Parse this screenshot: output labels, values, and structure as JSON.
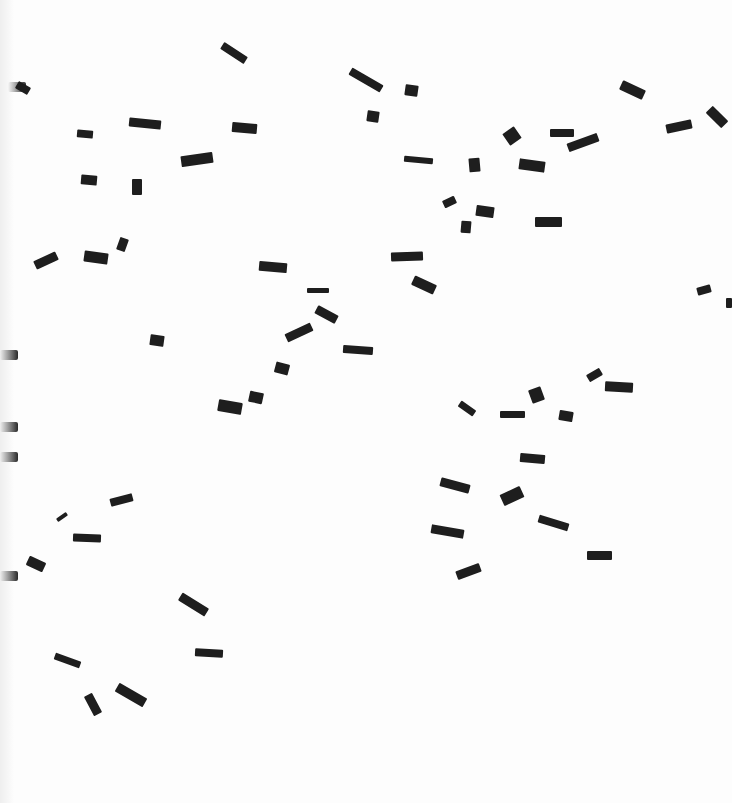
{
  "image": {
    "description": "Scanned white page with scattered small dark rectangular fragments",
    "background_color": "#fdfdfd",
    "piece_color": "#1e1e1e"
  },
  "edge_blots": [
    {
      "x": 8,
      "y": 82
    },
    {
      "x": 0,
      "y": 350
    },
    {
      "x": 0,
      "y": 422
    },
    {
      "x": 0,
      "y": 452
    },
    {
      "x": 0,
      "y": 571
    }
  ],
  "pieces": [
    {
      "x": 220,
      "y": 49,
      "w": 28,
      "h": 8,
      "r": 33
    },
    {
      "x": 16,
      "y": 84,
      "w": 14,
      "h": 8,
      "r": 30
    },
    {
      "x": 348,
      "y": 76,
      "w": 36,
      "h": 8,
      "r": 30
    },
    {
      "x": 405,
      "y": 85,
      "w": 13,
      "h": 11,
      "r": 8
    },
    {
      "x": 367,
      "y": 111,
      "w": 12,
      "h": 11,
      "r": 8
    },
    {
      "x": 77,
      "y": 130,
      "w": 16,
      "h": 8,
      "r": 5
    },
    {
      "x": 129,
      "y": 119,
      "w": 32,
      "h": 9,
      "r": 6
    },
    {
      "x": 232,
      "y": 123,
      "w": 25,
      "h": 10,
      "r": 5
    },
    {
      "x": 181,
      "y": 154,
      "w": 32,
      "h": 11,
      "r": -8
    },
    {
      "x": 505,
      "y": 129,
      "w": 14,
      "h": 14,
      "r": -35
    },
    {
      "x": 550,
      "y": 129,
      "w": 24,
      "h": 8,
      "r": 0
    },
    {
      "x": 567,
      "y": 138,
      "w": 32,
      "h": 9,
      "r": -20
    },
    {
      "x": 620,
      "y": 85,
      "w": 25,
      "h": 10,
      "r": 25
    },
    {
      "x": 666,
      "y": 122,
      "w": 26,
      "h": 9,
      "r": -12
    },
    {
      "x": 706,
      "y": 112,
      "w": 22,
      "h": 10,
      "r": 45
    },
    {
      "x": 404,
      "y": 157,
      "w": 29,
      "h": 6,
      "r": 5
    },
    {
      "x": 469,
      "y": 158,
      "w": 11,
      "h": 14,
      "r": -5
    },
    {
      "x": 519,
      "y": 160,
      "w": 26,
      "h": 11,
      "r": 8
    },
    {
      "x": 81,
      "y": 175,
      "w": 16,
      "h": 10,
      "r": 5
    },
    {
      "x": 132,
      "y": 179,
      "w": 10,
      "h": 16,
      "r": 0
    },
    {
      "x": 443,
      "y": 198,
      "w": 13,
      "h": 8,
      "r": -25
    },
    {
      "x": 476,
      "y": 206,
      "w": 18,
      "h": 11,
      "r": 8
    },
    {
      "x": 461,
      "y": 221,
      "w": 10,
      "h": 12,
      "r": 5
    },
    {
      "x": 535,
      "y": 217,
      "w": 27,
      "h": 10,
      "r": 0
    },
    {
      "x": 34,
      "y": 256,
      "w": 24,
      "h": 9,
      "r": -25
    },
    {
      "x": 84,
      "y": 252,
      "w": 24,
      "h": 11,
      "r": 8
    },
    {
      "x": 118,
      "y": 238,
      "w": 9,
      "h": 13,
      "r": 20
    },
    {
      "x": 259,
      "y": 262,
      "w": 28,
      "h": 10,
      "r": 5
    },
    {
      "x": 391,
      "y": 252,
      "w": 32,
      "h": 9,
      "r": -2
    },
    {
      "x": 412,
      "y": 280,
      "w": 24,
      "h": 10,
      "r": 25
    },
    {
      "x": 307,
      "y": 288,
      "w": 22,
      "h": 5,
      "r": 0
    },
    {
      "x": 315,
      "y": 310,
      "w": 23,
      "h": 9,
      "r": 28
    },
    {
      "x": 285,
      "y": 328,
      "w": 28,
      "h": 9,
      "r": -25
    },
    {
      "x": 150,
      "y": 335,
      "w": 14,
      "h": 11,
      "r": 8
    },
    {
      "x": 343,
      "y": 346,
      "w": 30,
      "h": 8,
      "r": 4
    },
    {
      "x": 275,
      "y": 363,
      "w": 14,
      "h": 11,
      "r": 15
    },
    {
      "x": 249,
      "y": 392,
      "w": 14,
      "h": 11,
      "r": 12
    },
    {
      "x": 218,
      "y": 401,
      "w": 24,
      "h": 12,
      "r": 10
    },
    {
      "x": 697,
      "y": 286,
      "w": 14,
      "h": 8,
      "r": -15
    },
    {
      "x": 726,
      "y": 298,
      "w": 6,
      "h": 10,
      "r": 0
    },
    {
      "x": 587,
      "y": 371,
      "w": 15,
      "h": 8,
      "r": -30
    },
    {
      "x": 605,
      "y": 382,
      "w": 28,
      "h": 10,
      "r": 3
    },
    {
      "x": 530,
      "y": 388,
      "w": 13,
      "h": 14,
      "r": -20
    },
    {
      "x": 458,
      "y": 405,
      "w": 18,
      "h": 7,
      "r": 35
    },
    {
      "x": 500,
      "y": 411,
      "w": 25,
      "h": 7,
      "r": 0
    },
    {
      "x": 559,
      "y": 411,
      "w": 14,
      "h": 10,
      "r": 10
    },
    {
      "x": 520,
      "y": 454,
      "w": 25,
      "h": 9,
      "r": 5
    },
    {
      "x": 440,
      "y": 481,
      "w": 30,
      "h": 9,
      "r": 15
    },
    {
      "x": 501,
      "y": 490,
      "w": 22,
      "h": 12,
      "r": -25
    },
    {
      "x": 110,
      "y": 496,
      "w": 23,
      "h": 8,
      "r": -15
    },
    {
      "x": 56,
      "y": 515,
      "w": 12,
      "h": 4,
      "r": -35
    },
    {
      "x": 73,
      "y": 534,
      "w": 28,
      "h": 8,
      "r": 2
    },
    {
      "x": 538,
      "y": 519,
      "w": 31,
      "h": 8,
      "r": 17
    },
    {
      "x": 431,
      "y": 527,
      "w": 33,
      "h": 9,
      "r": 10
    },
    {
      "x": 587,
      "y": 551,
      "w": 25,
      "h": 9,
      "r": 0
    },
    {
      "x": 27,
      "y": 559,
      "w": 18,
      "h": 10,
      "r": 25
    },
    {
      "x": 456,
      "y": 567,
      "w": 25,
      "h": 9,
      "r": -20
    },
    {
      "x": 178,
      "y": 600,
      "w": 31,
      "h": 9,
      "r": 32
    },
    {
      "x": 195,
      "y": 649,
      "w": 28,
      "h": 8,
      "r": 3
    },
    {
      "x": 54,
      "y": 657,
      "w": 27,
      "h": 7,
      "r": 20
    },
    {
      "x": 82,
      "y": 700,
      "w": 22,
      "h": 9,
      "r": 62
    },
    {
      "x": 115,
      "y": 690,
      "w": 32,
      "h": 10,
      "r": 30
    }
  ]
}
